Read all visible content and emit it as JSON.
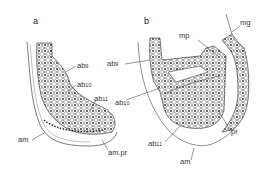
{
  "panels": [
    {
      "id": "a",
      "letter": "a",
      "labels": {
        "ab9": {
          "base": "ab",
          "sub": "9"
        },
        "ab10": {
          "base": "ab",
          "sub": "10"
        },
        "ab11": {
          "base": "ab",
          "sub": "11"
        },
        "am": {
          "base": "am"
        },
        "am_pr": {
          "base": "am.pr"
        }
      }
    },
    {
      "id": "b",
      "letter": "b",
      "labels": {
        "ab9": {
          "base": "ab",
          "sub": "9"
        },
        "ab10": {
          "base": "ab",
          "sub": "10"
        },
        "ab11": {
          "base": "ab",
          "sub": "11"
        },
        "mp": {
          "base": "mp"
        },
        "mg": {
          "base": "mg"
        },
        "pr": {
          "base": "pr"
        },
        "am": {
          "base": "am"
        }
      }
    }
  ],
  "colors": {
    "line": "#444444",
    "nucleus": "#222222",
    "background": "#ffffff"
  }
}
